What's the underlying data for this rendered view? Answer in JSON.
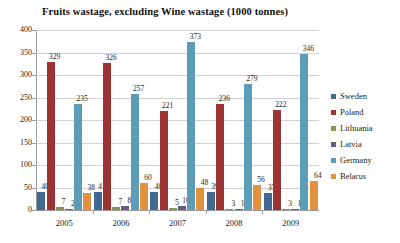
{
  "chart_data": {
    "type": "bar",
    "title": "Fruits wastage, excluding Wine wastage (1000 tonnes)",
    "xlabel": "",
    "ylabel": "",
    "categories": [
      "2005",
      "2006",
      "2007",
      "2008",
      "2009"
    ],
    "ylim": [
      0,
      400
    ],
    "yticks": [
      "0",
      "50",
      "100",
      "150",
      "200",
      "250",
      "300",
      "350",
      "400"
    ],
    "grid": true,
    "legend_position": "right",
    "series": [
      {
        "name": "Sweden",
        "color": "#436а90",
        "values": [
          40,
          41,
          40,
          39,
          37
        ]
      },
      {
        "name": "Poland",
        "color": "#9c3433",
        "values": [
          329,
          326,
          221,
          236,
          222
        ]
      },
      {
        "name": "Lithuania",
        "color": "#87974f",
        "values": [
          7,
          7,
          5,
          3,
          3
        ]
      },
      {
        "name": "Latvia",
        "color": "#6a5a80",
        "values": [
          2,
          8,
          10,
          1,
          1
        ]
      },
      {
        "name": "Germany",
        "color": "#5b9cb7",
        "values": [
          235,
          257,
          373,
          279,
          346
        ]
      },
      {
        "name": "Belarus",
        "color": "#e2913f",
        "values": [
          38,
          60,
          48,
          56,
          64
        ]
      }
    ],
    "colors": {
      "sweden": "#41688f",
      "poland": "#9c3433",
      "lithuania": "#87974f",
      "latvia": "#6a5a80",
      "germany": "#5b9cb7",
      "belarus": "#e2913f",
      "grid": "#d2d2d2",
      "axis": "#9a9a9a"
    }
  }
}
